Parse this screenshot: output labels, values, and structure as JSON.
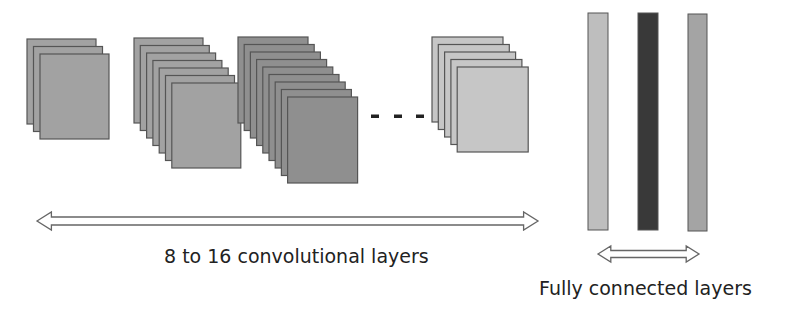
{
  "conv_groups": [
    {
      "name": "conv-group-1",
      "sheets": 3,
      "x0": 27,
      "y0": 39,
      "dx": 6.5,
      "dy": 7.5,
      "w": 69,
      "h": 85,
      "fill": "#a2a2a2"
    },
    {
      "name": "conv-group-2",
      "sheets": 7,
      "x0": 134,
      "y0": 38,
      "dx": 6.3,
      "dy": 7.5,
      "w": 69,
      "h": 85,
      "fill": "#a2a2a2"
    },
    {
      "name": "conv-group-3",
      "sheets": 9,
      "x0": 238,
      "y0": 37,
      "dx": 6.2,
      "dy": 7.5,
      "w": 70,
      "h": 86,
      "fill": "#8f8f8f"
    },
    {
      "name": "conv-group-4",
      "sheets": 5,
      "x0": 432,
      "y0": 37,
      "dx": 6.3,
      "dy": 7.5,
      "w": 71,
      "h": 85,
      "fill": "#c6c6c6"
    }
  ],
  "ellipsis_dots": [
    {
      "x": 375,
      "y": 116
    },
    {
      "x": 398,
      "y": 116
    },
    {
      "x": 420,
      "y": 116
    }
  ],
  "fc_bars": [
    {
      "name": "fc-bar-1",
      "x": 588,
      "y": 13,
      "w": 20,
      "h": 217,
      "fill": "#bebebe"
    },
    {
      "name": "fc-bar-2",
      "x": 638,
      "y": 13,
      "w": 20,
      "h": 217,
      "fill": "#393939"
    },
    {
      "name": "fc-bar-3",
      "x": 688,
      "y": 14,
      "w": 19,
      "h": 217,
      "fill": "#a4a4a4"
    }
  ],
  "arrows": {
    "conv": {
      "x1": 37,
      "x2": 538,
      "y": 221,
      "half_height": 9,
      "shaft_half": 4
    },
    "fc": {
      "x1": 598,
      "x2": 699,
      "y": 254,
      "half_height": 8,
      "shaft_half": 3.5
    }
  },
  "labels": {
    "conv": "8 to 16 convolutional layers",
    "fc": "Fully connected layers"
  },
  "colors": {
    "stroke": "#555555",
    "arrow_stroke": "#666666",
    "text": "#222222"
  }
}
